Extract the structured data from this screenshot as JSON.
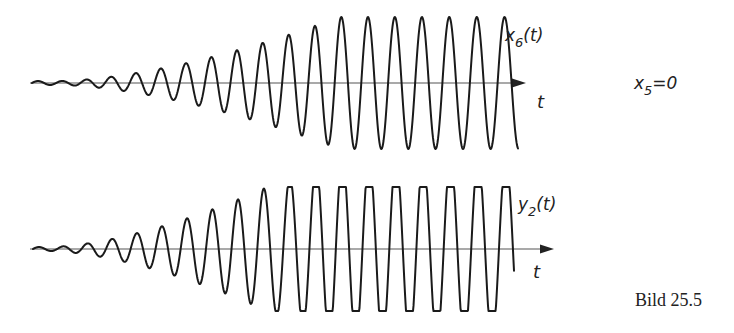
{
  "figure": {
    "caption": "Bild 25.5",
    "condition": {
      "var": "x",
      "sub": "5",
      "rest": "=0"
    }
  },
  "plots": [
    {
      "id": "x6",
      "signal_label": {
        "var": "x",
        "sub": "6",
        "rest": "(t)"
      },
      "axis_label": "t",
      "axis_y": 83,
      "x_start": 32,
      "x_end": 518,
      "axis_end": 524,
      "period_start": 24,
      "period_end": 28,
      "amp_start": 2,
      "amp_max": 66,
      "ramp_start_x": 60,
      "ramp_end_x": 340,
      "clip": null
    },
    {
      "id": "y2",
      "signal_label": {
        "var": "y",
        "sub": "2",
        "rest": "(t)"
      },
      "axis_label": "t",
      "axis_y": 249,
      "x_start": 33,
      "x_end": 514,
      "axis_end": 552,
      "period_start": 24,
      "period_end": 28,
      "amp_start": 2,
      "amp_max": 92,
      "ramp_start_x": 50,
      "ramp_end_x": 330,
      "clip": 62
    }
  ]
}
